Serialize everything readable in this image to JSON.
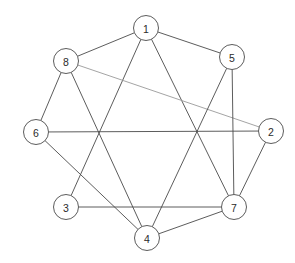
{
  "diagram": {
    "type": "node-link-graph",
    "background_color": "#ffffff",
    "edge_color": "#4a4a4a",
    "faint_edge_color": "#9a9a9a",
    "node_fill": "#ffffff",
    "node_stroke": "#4a4a4a",
    "label_color": "#2b2b2b",
    "node_radius": 12.5
  },
  "nodes": [
    {
      "id": "1",
      "label": "1",
      "x": 146,
      "y": 28
    },
    {
      "id": "2",
      "label": "2",
      "x": 271,
      "y": 131
    },
    {
      "id": "3",
      "label": "3",
      "x": 66,
      "y": 207
    },
    {
      "id": "4",
      "label": "4",
      "x": 147,
      "y": 238
    },
    {
      "id": "5",
      "label": "5",
      "x": 232,
      "y": 57
    },
    {
      "id": "6",
      "label": "6",
      "x": 36,
      "y": 132
    },
    {
      "id": "7",
      "label": "7",
      "x": 234,
      "y": 207
    },
    {
      "id": "8",
      "label": "8",
      "x": 66,
      "y": 61
    }
  ],
  "edges": [
    {
      "source": "1",
      "target": "8",
      "style": "solid"
    },
    {
      "source": "1",
      "target": "5",
      "style": "solid"
    },
    {
      "source": "1",
      "target": "3",
      "style": "solid"
    },
    {
      "source": "1",
      "target": "7",
      "style": "solid"
    },
    {
      "source": "8",
      "target": "2",
      "style": "faint"
    },
    {
      "source": "8",
      "target": "6",
      "style": "solid"
    },
    {
      "source": "8",
      "target": "4",
      "style": "solid"
    },
    {
      "source": "5",
      "target": "4",
      "style": "solid"
    },
    {
      "source": "5",
      "target": "7",
      "style": "solid"
    },
    {
      "source": "6",
      "target": "2",
      "style": "solid"
    },
    {
      "source": "6",
      "target": "4",
      "style": "solid"
    },
    {
      "source": "2",
      "target": "7",
      "style": "solid"
    },
    {
      "source": "3",
      "target": "7",
      "style": "solid"
    },
    {
      "source": "4",
      "target": "7",
      "style": "solid"
    }
  ],
  "chart_data": {
    "type": "table",
    "vertices": [
      "1",
      "2",
      "3",
      "4",
      "5",
      "6",
      "7",
      "8"
    ],
    "edge_list": [
      [
        "1",
        "8"
      ],
      [
        "1",
        "5"
      ],
      [
        "1",
        "3"
      ],
      [
        "1",
        "7"
      ],
      [
        "8",
        "2"
      ],
      [
        "8",
        "6"
      ],
      [
        "8",
        "4"
      ],
      [
        "5",
        "4"
      ],
      [
        "5",
        "7"
      ],
      [
        "6",
        "2"
      ],
      [
        "6",
        "4"
      ],
      [
        "2",
        "7"
      ],
      [
        "3",
        "7"
      ],
      [
        "4",
        "7"
      ]
    ],
    "degrees": {
      "1": 4,
      "2": 3,
      "3": 2,
      "4": 4,
      "5": 3,
      "6": 3,
      "7": 5,
      "8": 4
    },
    "edge_count": 14,
    "vertex_count": 8
  }
}
